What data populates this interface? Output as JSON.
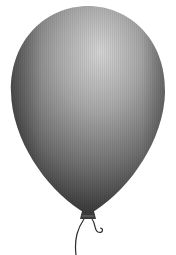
{
  "image": {
    "subject": "balloon",
    "style": "grayscale illustration",
    "background": "#ffffff",
    "colors": {
      "balloon_dark": "#3a3a3a",
      "balloon_mid": "#7a7a7a",
      "balloon_highlight": "#d0d0d0",
      "string": "#2a2a2a"
    }
  }
}
